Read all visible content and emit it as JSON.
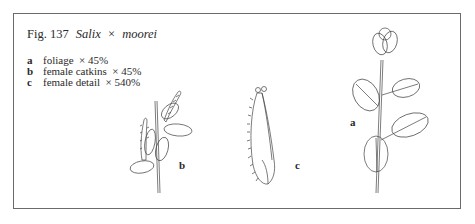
{
  "figure": {
    "number_label": "Fig. 137",
    "genus": "Salix",
    "cross": "×",
    "epithet": "moorei"
  },
  "legend": [
    {
      "key": "a",
      "text": "foliage",
      "scale": "× 45%"
    },
    {
      "key": "b",
      "text": "female catkins",
      "scale": "× 45%"
    },
    {
      "key": "c",
      "text": "female detail",
      "scale": "× 540%"
    }
  ],
  "drawing_labels": {
    "a": "a",
    "b": "b",
    "c": "c"
  },
  "colors": {
    "frame": "#6a6a6a",
    "ink": "#2a2a2a"
  }
}
